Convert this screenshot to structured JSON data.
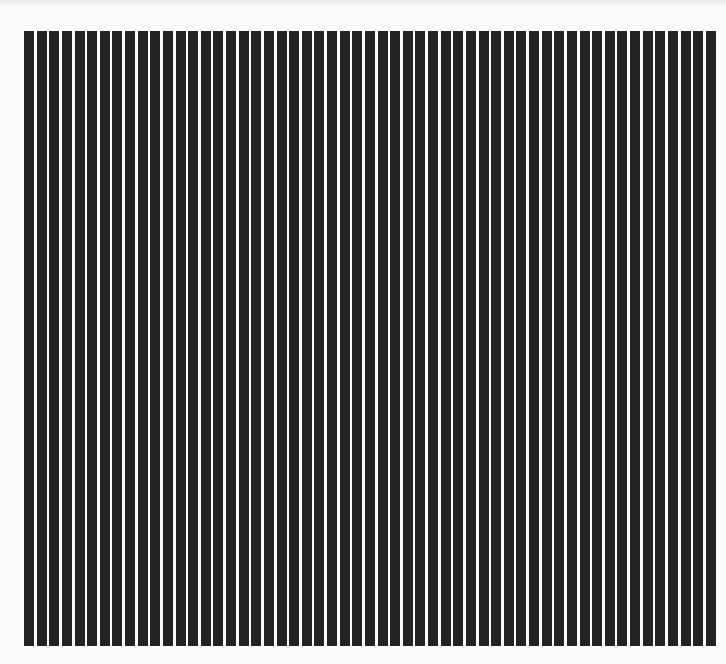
{
  "image": {
    "description": "Scanned pattern of evenly spaced vertical black stripes on white background",
    "stripe_count": 55,
    "stripe_color": "#232323",
    "background_color": "#fbfbfb",
    "stripe_width_px": 10,
    "stripe_pitch_px": 12.6
  }
}
